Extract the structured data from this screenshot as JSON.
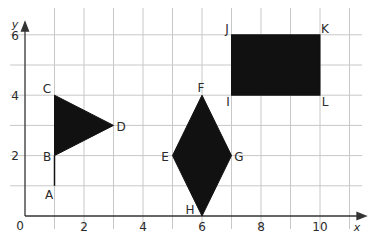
{
  "diagram": {
    "type": "coordinate-grid",
    "axes": {
      "x_label": "x",
      "y_label": "y",
      "origin_label": "0",
      "x_ticks": [
        "2",
        "4",
        "6",
        "8",
        "10"
      ],
      "y_ticks": [
        "2",
        "4",
        "6"
      ],
      "x_range": [
        0,
        11
      ],
      "y_range": [
        0,
        6
      ]
    },
    "colors": {
      "grid": "#c8c8c8",
      "axis": "#333333",
      "fill": "#111111"
    },
    "points": {
      "A": {
        "label": "A",
        "x": 1,
        "y": 1
      },
      "B": {
        "label": "B",
        "x": 1,
        "y": 2
      },
      "C": {
        "label": "C",
        "x": 1,
        "y": 4
      },
      "D": {
        "label": "D",
        "x": 3,
        "y": 3
      },
      "E": {
        "label": "E",
        "x": 5,
        "y": 2
      },
      "F": {
        "label": "F",
        "x": 6,
        "y": 4
      },
      "G": {
        "label": "G",
        "x": 7,
        "y": 2
      },
      "H": {
        "label": "H",
        "x": 6,
        "y": 0
      },
      "I": {
        "label": "I",
        "x": 7,
        "y": 4
      },
      "J": {
        "label": "J",
        "x": 7,
        "y": 6
      },
      "K": {
        "label": "K",
        "x": 10,
        "y": 6
      },
      "L": {
        "label": "L",
        "x": 10,
        "y": 4
      }
    },
    "shapes": [
      {
        "name": "triangle-BCD",
        "vertices": [
          "B",
          "C",
          "D"
        ],
        "filled": true
      },
      {
        "name": "segment-AB",
        "vertices": [
          "A",
          "B"
        ],
        "filled": false
      },
      {
        "name": "rhombus-EFGH",
        "vertices": [
          "E",
          "F",
          "G",
          "H"
        ],
        "filled": true
      },
      {
        "name": "rectangle-IJKL",
        "vertices": [
          "I",
          "J",
          "K",
          "L"
        ],
        "filled": true
      }
    ]
  }
}
